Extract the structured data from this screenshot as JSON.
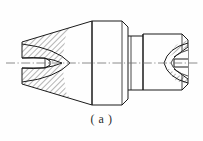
{
  "figure": {
    "caption": "( a )",
    "type": "engineering-section-drawing",
    "view_label": "a"
  },
  "colors": {
    "background": "#fefefe",
    "outline": "#1a1a1a",
    "hatch": "#2a2a2a",
    "centerline": "#6f6f6f",
    "caption_text": "#2b2b2b"
  },
  "line_styles": {
    "outline_width": 1.0,
    "hatch_width": 0.6,
    "centerline_width": 0.7,
    "centerline_pattern": "dash-dot"
  },
  "geometry": {
    "canvas": {
      "width": 203,
      "height": 141
    },
    "axis_y": 63,
    "axis_x_start": 6,
    "axis_x_end": 198,
    "left_cone": {
      "name": "tapered-body",
      "left_face_x": 22,
      "left_face_top_y": 42,
      "left_face_bottom_y": 84,
      "right_x": 92,
      "right_top_y": 21,
      "right_bottom_y": 105
    },
    "mid_cylinder": {
      "name": "cylindrical-collar",
      "left_x": 92,
      "right_x": 128,
      "top_y": 21,
      "bottom_y": 105,
      "chamfer": 6
    },
    "neck": {
      "name": "connecting-neck",
      "left_x": 128,
      "right_x": 143,
      "top_y": 36,
      "bottom_y": 90
    },
    "right_block": {
      "name": "end-cap",
      "left_x": 143,
      "right_x": 188,
      "top_y": 34,
      "bottom_y": 90,
      "chamfer": 6
    },
    "left_bore": {
      "name": "central-bore",
      "x_start": 22,
      "x_end": 45,
      "half_height": 5
    },
    "left_conical_recess": {
      "name": "conical-recess",
      "apex_x": 62,
      "mouth_x": 22,
      "mouth_half_height": 21
    },
    "right_conical_hole": {
      "name": "conical-through-hole",
      "apex_x": 158,
      "mouth_x": 188,
      "mouth_half_height": 16,
      "bore_half_height": 4
    }
  },
  "annotations": {
    "hatch_angle_deg": 45,
    "hatch_spacing_px": 4,
    "section_regions": [
      "left-upper-hatch",
      "left-lower-hatch",
      "right-upper-hatch",
      "right-lower-hatch"
    ]
  }
}
